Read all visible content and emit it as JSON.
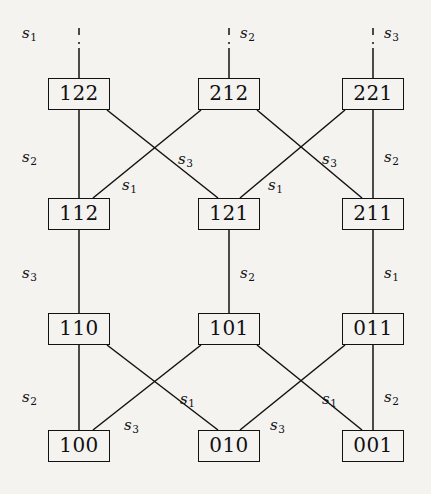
{
  "diagram": {
    "background_color": "#f4f3f0",
    "line_color": "#121212",
    "rows": [
      {
        "row": 1,
        "nodes": [
          "122",
          "212",
          "221"
        ]
      },
      {
        "row": 2,
        "nodes": [
          "112",
          "121",
          "211"
        ]
      },
      {
        "row": 3,
        "nodes": [
          "110",
          "101",
          "011"
        ]
      },
      {
        "row": 4,
        "nodes": [
          "100",
          "010",
          "001"
        ]
      }
    ],
    "nodes": [
      {
        "id": "n122",
        "label": "122",
        "x": 48,
        "y": 78,
        "w": 62,
        "h": 32
      },
      {
        "id": "n212",
        "label": "212",
        "x": 198,
        "y": 78,
        "w": 62,
        "h": 32
      },
      {
        "id": "n221",
        "label": "221",
        "x": 342,
        "y": 78,
        "w": 62,
        "h": 32
      },
      {
        "id": "n112",
        "label": "112",
        "x": 48,
        "y": 198,
        "w": 62,
        "h": 32
      },
      {
        "id": "n121",
        "label": "121",
        "x": 198,
        "y": 198,
        "w": 62,
        "h": 32
      },
      {
        "id": "n211",
        "label": "211",
        "x": 342,
        "y": 198,
        "w": 62,
        "h": 32
      },
      {
        "id": "n110",
        "label": "110",
        "x": 48,
        "y": 313,
        "w": 62,
        "h": 32
      },
      {
        "id": "n101",
        "label": "101",
        "x": 198,
        "y": 313,
        "w": 62,
        "h": 32
      },
      {
        "id": "n011",
        "label": "011",
        "x": 342,
        "y": 313,
        "w": 62,
        "h": 32
      },
      {
        "id": "n100",
        "label": "100",
        "x": 48,
        "y": 430,
        "w": 62,
        "h": 32
      },
      {
        "id": "n010",
        "label": "010",
        "x": 198,
        "y": 430,
        "w": 62,
        "h": 32
      },
      {
        "id": "n001",
        "label": "001",
        "x": 342,
        "y": 430,
        "w": 62,
        "h": 32
      }
    ],
    "dangling_edges": [
      {
        "id": "d1",
        "to": "122",
        "label": "s1",
        "label_text": "s",
        "label_sub": "1",
        "dashed": true
      },
      {
        "id": "d2",
        "to": "212",
        "label": "s2",
        "label_text": "s",
        "label_sub": "2",
        "dashed": true
      },
      {
        "id": "d3",
        "to": "221",
        "label": "s3",
        "label_text": "s",
        "label_sub": "3",
        "dashed": true
      }
    ],
    "edges": [
      {
        "from": "122",
        "to": "112",
        "label_text": "s",
        "label_sub": "2",
        "kind": "vertical"
      },
      {
        "from": "122",
        "to": "121",
        "label_text": "s",
        "label_sub": "3",
        "kind": "diagonal"
      },
      {
        "from": "212",
        "to": "112",
        "label_text": "s",
        "label_sub": "1",
        "kind": "diagonal"
      },
      {
        "from": "212",
        "to": "211",
        "label_text": "s",
        "label_sub": "3",
        "kind": "diagonal"
      },
      {
        "from": "221",
        "to": "121",
        "label_text": "s",
        "label_sub": "1",
        "kind": "diagonal"
      },
      {
        "from": "221",
        "to": "211",
        "label_text": "s",
        "label_sub": "2",
        "kind": "vertical"
      },
      {
        "from": "112",
        "to": "110",
        "label_text": "s",
        "label_sub": "3",
        "kind": "vertical"
      },
      {
        "from": "121",
        "to": "101",
        "label_text": "s",
        "label_sub": "2",
        "kind": "vertical"
      },
      {
        "from": "211",
        "to": "011",
        "label_text": "s",
        "label_sub": "1",
        "kind": "vertical"
      },
      {
        "from": "110",
        "to": "100",
        "label_text": "s",
        "label_sub": "2",
        "kind": "vertical"
      },
      {
        "from": "110",
        "to": "010",
        "label_text": "s",
        "label_sub": "1",
        "kind": "diagonal"
      },
      {
        "from": "101",
        "to": "100",
        "label_text": "s",
        "label_sub": "3",
        "kind": "diagonal"
      },
      {
        "from": "101",
        "to": "001",
        "label_text": "s",
        "label_sub": "1",
        "kind": "diagonal"
      },
      {
        "from": "011",
        "to": "010",
        "label_text": "s",
        "label_sub": "3",
        "kind": "diagonal"
      },
      {
        "from": "011",
        "to": "001",
        "label_text": "s",
        "label_sub": "2",
        "kind": "vertical"
      }
    ],
    "labels": [
      {
        "id": "lbl-top-s1",
        "text": "s",
        "sub": "1",
        "x": 22,
        "y": 26
      },
      {
        "id": "lbl-top-s2",
        "text": "s",
        "sub": "2",
        "x": 240,
        "y": 26
      },
      {
        "id": "lbl-top-s3",
        "text": "s",
        "sub": "3",
        "x": 384,
        "y": 26
      },
      {
        "id": "lbl-r12-s2",
        "text": "s",
        "sub": "2",
        "x": 22,
        "y": 150
      },
      {
        "id": "lbl-r12-s1a",
        "text": "s",
        "sub": "1",
        "x": 122,
        "y": 178
      },
      {
        "id": "lbl-r12-s3a",
        "text": "s",
        "sub": "3",
        "x": 178,
        "y": 152
      },
      {
        "id": "lbl-r12-s1b",
        "text": "s",
        "sub": "1",
        "x": 268,
        "y": 178
      },
      {
        "id": "lbl-r12-s3b",
        "text": "s",
        "sub": "3",
        "x": 322,
        "y": 152
      },
      {
        "id": "lbl-r12-s2b",
        "text": "s",
        "sub": "2",
        "x": 384,
        "y": 150
      },
      {
        "id": "lbl-r23-s3",
        "text": "s",
        "sub": "3",
        "x": 22,
        "y": 266
      },
      {
        "id": "lbl-r23-s2",
        "text": "s",
        "sub": "2",
        "x": 240,
        "y": 266
      },
      {
        "id": "lbl-r23-s1",
        "text": "s",
        "sub": "1",
        "x": 384,
        "y": 266
      },
      {
        "id": "lbl-r34-s2",
        "text": "s",
        "sub": "2",
        "x": 22,
        "y": 390
      },
      {
        "id": "lbl-r34-s3a",
        "text": "s",
        "sub": "3",
        "x": 124,
        "y": 418
      },
      {
        "id": "lbl-r34-s1a",
        "text": "s",
        "sub": "1",
        "x": 180,
        "y": 392
      },
      {
        "id": "lbl-r34-s3b",
        "text": "s",
        "sub": "3",
        "x": 270,
        "y": 418
      },
      {
        "id": "lbl-r34-s1b",
        "text": "s",
        "sub": "1",
        "x": 322,
        "y": 392
      },
      {
        "id": "lbl-r34-s2b",
        "text": "s",
        "sub": "2",
        "x": 384,
        "y": 390
      }
    ]
  }
}
